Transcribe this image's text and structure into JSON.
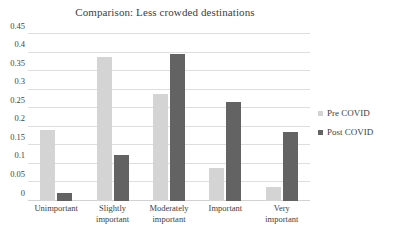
{
  "chart_data": {
    "type": "bar",
    "title": "Comparison: Less crowded destinations",
    "xlabel": "",
    "ylabel": "",
    "ylim": [
      0,
      0.45
    ],
    "yticks": [
      "0",
      "0.05",
      "0.1",
      "0.15",
      "0.2",
      "0.25",
      "0.3",
      "0.35",
      "0.4",
      "0.45"
    ],
    "ytick_values": [
      0,
      0.05,
      0.1,
      0.15,
      0.2,
      0.25,
      0.3,
      0.35,
      0.4,
      0.45
    ],
    "grid": true,
    "legend_position": "right",
    "categories": [
      "Unimportant",
      "Slightly important",
      "Moderately important",
      "Important",
      "Very important"
    ],
    "category_lines": [
      [
        "Unimportant"
      ],
      [
        "Slightly",
        "important"
      ],
      [
        "Moderately",
        "important"
      ],
      [
        "Important"
      ],
      [
        "Very",
        "important"
      ]
    ],
    "series": [
      {
        "name": "Pre COVID",
        "color": "#d4d4d4",
        "values": [
          0.192,
          0.389,
          0.288,
          0.088,
          0.039
        ]
      },
      {
        "name": "Post COVID",
        "color": "#636363",
        "values": [
          0.022,
          0.125,
          0.396,
          0.267,
          0.186
        ]
      }
    ]
  },
  "legend": {
    "items": [
      {
        "label": "Pre COVID",
        "swatch": "pre"
      },
      {
        "label": "Post COVID",
        "swatch": "post"
      }
    ]
  }
}
